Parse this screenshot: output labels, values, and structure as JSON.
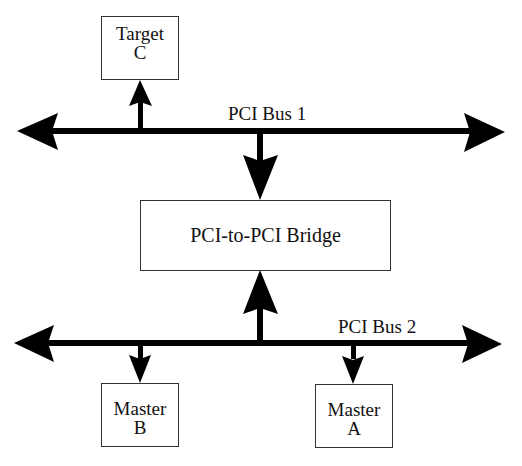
{
  "diagram": {
    "type": "block-diagram",
    "colors": {
      "line": "#000000",
      "box_border": "#333333",
      "background": "#ffffff",
      "text": "#111111"
    },
    "buses": [
      {
        "id": "bus-1",
        "label": "PCI Bus 1",
        "bidirectional": true
      },
      {
        "id": "bus-2",
        "label": "PCI Bus 2",
        "bidirectional": true
      }
    ],
    "nodes": {
      "target_c": {
        "line1": "Target",
        "line2": "C"
      },
      "bridge": {
        "label": "PCI-to-PCI Bridge"
      },
      "master_b": {
        "line1": "Master",
        "line2": "B"
      },
      "master_a": {
        "line1": "Master",
        "line2": "A"
      }
    },
    "connections": [
      {
        "from": "PCI Bus 1",
        "to": "Target C",
        "direction": "up"
      },
      {
        "from": "PCI Bus 1",
        "to": "PCI-to-PCI Bridge",
        "direction": "down"
      },
      {
        "from": "PCI Bus 2",
        "to": "PCI-to-PCI Bridge",
        "direction": "up"
      },
      {
        "from": "PCI Bus 2",
        "to": "Master B",
        "direction": "down"
      },
      {
        "from": "PCI Bus 2",
        "to": "Master A",
        "direction": "down"
      }
    ]
  }
}
